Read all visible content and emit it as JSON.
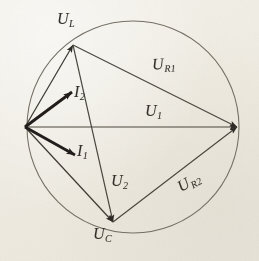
{
  "figure": {
    "type": "phasor-vector-diagram",
    "title": "",
    "background_color": "#f1eee6",
    "ink_color": "#3a3630",
    "thin_line_color": "#5d584e",
    "circle": {
      "center_x": 133,
      "center_y": 127,
      "radius": 106,
      "stroke_width": 1.0
    },
    "points": {
      "origin": {
        "x": 25,
        "y": 127
      },
      "u_l_tip": {
        "x": 73,
        "y": 45
      },
      "right_tip": {
        "x": 237,
        "y": 127
      },
      "u_c_tip": {
        "x": 113,
        "y": 222
      },
      "i2_tip": {
        "x": 72,
        "y": 92
      },
      "i1_tip": {
        "x": 75,
        "y": 155
      }
    },
    "vectors": [
      {
        "id": "U_L",
        "from": "origin",
        "to": "u_l_tip",
        "weight": "thin",
        "arrow": "filled",
        "label": "U",
        "sub": "L"
      },
      {
        "id": "I_2",
        "from": "origin",
        "to": "i2_tip",
        "weight": "thick",
        "arrow": "filled",
        "label": "I",
        "sub": "2"
      },
      {
        "id": "U_1",
        "from": "origin",
        "to": "right_tip",
        "weight": "thin",
        "arrow": "filled",
        "label": "U",
        "sub": "1"
      },
      {
        "id": "I_1",
        "from": "origin",
        "to": "i1_tip",
        "weight": "thick",
        "arrow": "filled",
        "label": "I",
        "sub": "1"
      },
      {
        "id": "U_C",
        "from": "origin",
        "to": "u_c_tip",
        "weight": "thin",
        "arrow": "filled",
        "label": "U",
        "sub": "C"
      },
      {
        "id": "U_R1",
        "from": "u_l_tip",
        "to": "right_tip",
        "weight": "thin",
        "arrow": "filled",
        "label": "U",
        "sub": "R1"
      },
      {
        "id": "U_2",
        "from": "u_l_tip",
        "to": "u_c_tip",
        "weight": "thin",
        "arrow": "filled",
        "label": "U",
        "sub": "2"
      },
      {
        "id": "U_R2",
        "from": "u_c_tip",
        "to": "right_tip",
        "weight": "thin",
        "arrow": "filled",
        "label": "U",
        "sub": "R2"
      }
    ],
    "labels": {
      "u_l": {
        "base": "U",
        "sub": "L",
        "x": 57,
        "y": 11
      },
      "u_r1": {
        "base": "U",
        "sub": "R1",
        "x": 152,
        "y": 56
      },
      "i_2": {
        "base": "I",
        "sub": "2",
        "x": 74,
        "y": 84
      },
      "u_1": {
        "base": "U",
        "sub": "1",
        "x": 145,
        "y": 103
      },
      "i_1": {
        "base": "I",
        "sub": "1",
        "x": 77,
        "y": 143
      },
      "u_2": {
        "base": "U",
        "sub": "2",
        "x": 111,
        "y": 173
      },
      "u_r2": {
        "base": "U",
        "sub": "R2",
        "x": 177,
        "y": 174
      },
      "u_c": {
        "base": "U",
        "sub": "C",
        "x": 93,
        "y": 226
      }
    }
  }
}
